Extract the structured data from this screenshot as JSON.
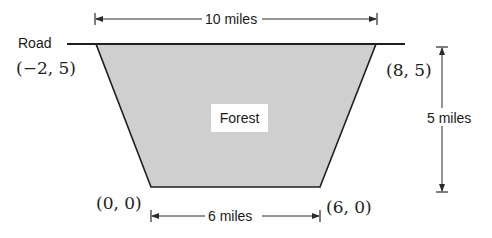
{
  "diagram": {
    "road_label": "Road",
    "region_label": "Forest",
    "vertices": [
      {
        "id": "top-left",
        "label": "(−2, 5)",
        "x": -2,
        "y": 5
      },
      {
        "id": "top-right",
        "label": "(8, 5)",
        "x": 8,
        "y": 5
      },
      {
        "id": "bottom-left",
        "label": "(0, 0)",
        "x": 0,
        "y": 0
      },
      {
        "id": "bottom-right",
        "label": "(6, 0)",
        "x": 6,
        "y": 0
      }
    ],
    "dimensions": {
      "top_width": "10 miles",
      "bottom_width": "6 miles",
      "height": "5 miles"
    },
    "colors": {
      "fill": "#cfcfcf",
      "stroke": "#1f1f1f",
      "background": "#ffffff"
    }
  }
}
